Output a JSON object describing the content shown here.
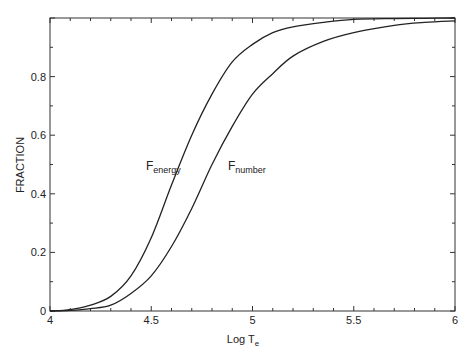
{
  "chart_data": {
    "type": "line",
    "title": "",
    "xlabel": "Log T",
    "xlabel_subscript": "e",
    "ylabel": "FRACTION",
    "xlim": [
      4,
      6
    ],
    "ylim": [
      0,
      1
    ],
    "grid": false,
    "legend": "inline labels",
    "x_ticks": [
      "4",
      "4.5",
      "5",
      "5.5",
      "6"
    ],
    "y_ticks": [
      "0",
      "0.2",
      "0.4",
      "0.6",
      "0.8"
    ],
    "x": [
      4.0,
      4.1,
      4.2,
      4.3,
      4.4,
      4.5,
      4.6,
      4.7,
      4.8,
      4.9,
      5.0,
      5.1,
      5.2,
      5.35,
      5.5,
      5.7,
      5.85,
      6.0
    ],
    "series": [
      {
        "name": "F_energy",
        "label_main": "F",
        "label_sub": "energy",
        "values": [
          0.0,
          0.005,
          0.02,
          0.05,
          0.12,
          0.25,
          0.43,
          0.6,
          0.74,
          0.85,
          0.91,
          0.95,
          0.97,
          0.985,
          0.995,
          0.998,
          0.999,
          1.0
        ]
      },
      {
        "name": "F_number",
        "label_main": "F",
        "label_sub": "number",
        "values": [
          0.0,
          0.002,
          0.008,
          0.02,
          0.06,
          0.12,
          0.22,
          0.35,
          0.5,
          0.63,
          0.74,
          0.81,
          0.87,
          0.92,
          0.95,
          0.975,
          0.985,
          0.99
        ]
      }
    ]
  }
}
